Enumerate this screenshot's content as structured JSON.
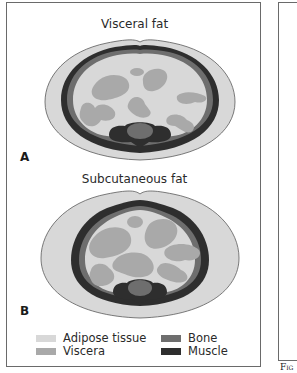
{
  "figure": {
    "panel_a": {
      "title": "Visceral fat",
      "label": "A"
    },
    "panel_b": {
      "title": "Subcutaneous fat",
      "label": "B"
    },
    "legend": [
      {
        "label": "Adipose tissue",
        "color": "#d8d8d8"
      },
      {
        "label": "Viscera",
        "color": "#a9a9a9"
      },
      {
        "label": "Bone",
        "color": "#6e6e6e"
      },
      {
        "label": "Muscle",
        "color": "#2e2e2e"
      }
    ],
    "caption_fragment": "Fig"
  },
  "colors": {
    "adipose": "#d8d8d8",
    "viscera": "#a9a9a9",
    "bone": "#6e6e6e",
    "muscle": "#2e2e2e",
    "outline": "#6a6a6a"
  }
}
